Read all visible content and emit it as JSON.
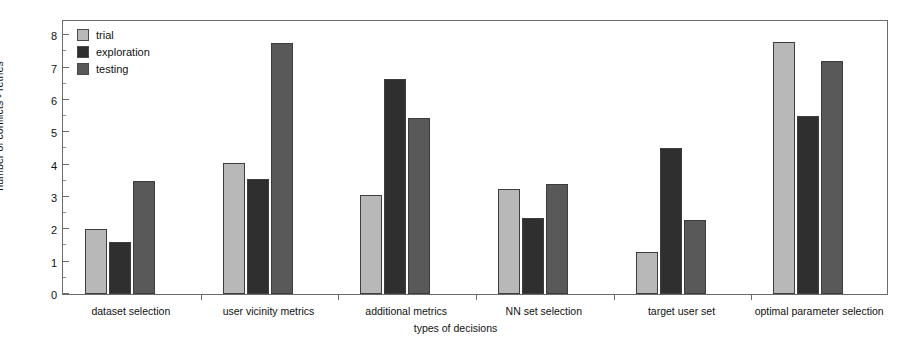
{
  "chart_data": {
    "type": "bar",
    "title": "",
    "xlabel": "types of decisions",
    "ylabel": "number of conflicts - retries",
    "ylim": [
      0,
      8.5
    ],
    "yticks": [
      0,
      1,
      2,
      3,
      4,
      5,
      6,
      7,
      8
    ],
    "ytick_labels": [
      "0",
      "1",
      "2",
      "3",
      "4",
      "5",
      "6",
      "7",
      "8"
    ],
    "minor_ticks": true,
    "grid": false,
    "legend_position": "top-left",
    "categories": [
      "dataset selection",
      "user vicinity metrics",
      "additional metrics",
      "NN set selection",
      "target user set",
      "optimal parameter selection"
    ],
    "series": [
      {
        "name": "trial",
        "color": "#b8b8b8",
        "values": [
          2.0,
          4.05,
          3.05,
          3.25,
          1.3,
          7.8
        ]
      },
      {
        "name": "exploration",
        "color": "#2f2f2f",
        "values": [
          1.6,
          3.55,
          6.65,
          2.35,
          4.5,
          5.5
        ]
      },
      {
        "name": "testing",
        "color": "#595959",
        "values": [
          3.5,
          7.75,
          5.45,
          3.4,
          2.3,
          7.2
        ]
      }
    ]
  },
  "legend": {
    "items": [
      {
        "label": "trial"
      },
      {
        "label": "exploration"
      },
      {
        "label": "testing"
      }
    ]
  },
  "axes": {
    "x_title": "types of decisions",
    "y_title": "number of conflicts - retries"
  },
  "colors": {
    "frame": "#6b6b6b",
    "background": "#ffffff",
    "text": "#111111"
  }
}
